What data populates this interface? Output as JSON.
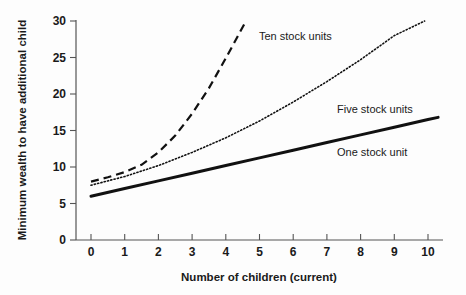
{
  "chart_data": {
    "type": "line",
    "title": "",
    "xlabel": "Number of children (current)",
    "ylabel": "Minimum wealth to have additional child",
    "xlim": [
      0,
      10
    ],
    "ylim": [
      0,
      30
    ],
    "xticks": [
      "0",
      "1",
      "2",
      "3",
      "4",
      "5",
      "6",
      "7",
      "8",
      "9",
      "10"
    ],
    "yticks": [
      "0",
      "5",
      "10",
      "15",
      "20",
      "25",
      "30"
    ],
    "grid": false,
    "legend_position": "inline-annotations",
    "series": [
      {
        "name": "One stock unit",
        "style": "solid",
        "x": [
          0,
          1,
          2,
          3,
          4,
          5,
          6,
          7,
          8,
          9,
          10,
          10.3
        ],
        "values": [
          6.0,
          7.05,
          8.1,
          9.15,
          10.2,
          11.25,
          12.3,
          13.35,
          14.4,
          15.45,
          16.5,
          16.8
        ]
      },
      {
        "name": "Five stock units",
        "style": "dotted",
        "x": [
          0,
          1,
          2,
          3,
          4,
          5,
          6,
          7,
          8,
          9,
          9.9
        ],
        "values": [
          7.5,
          8.7,
          10.2,
          12.0,
          14.0,
          16.3,
          18.9,
          21.7,
          24.7,
          28.0,
          30.0
        ]
      },
      {
        "name": "Ten stock units",
        "style": "dashed",
        "x": [
          0,
          0.5,
          1,
          1.5,
          2,
          2.5,
          3,
          3.5,
          4,
          4.6
        ],
        "values": [
          8.0,
          8.6,
          9.3,
          10.3,
          12.0,
          14.3,
          17.3,
          20.8,
          24.9,
          30.0
        ]
      }
    ],
    "annotations": [
      {
        "text": "Ten stock units",
        "x": 5.0,
        "y": 27.2
      },
      {
        "text": "Five stock units",
        "x": 7.9,
        "y": 19.2
      },
      {
        "text": "One stock unit",
        "x": 7.9,
        "y": 12.6
      }
    ]
  }
}
